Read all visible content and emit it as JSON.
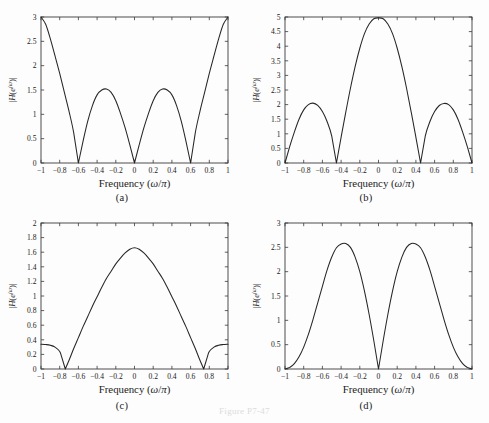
{
  "figure": {
    "caption": "Figure P7-47",
    "background": "#fdfdfd",
    "line_color": "#262626",
    "axis_color": "#3a3a3a"
  },
  "panels": [
    {
      "key": "a",
      "caption": "(a)"
    },
    {
      "key": "b",
      "caption": "(b)"
    },
    {
      "key": "c",
      "caption": "(c)"
    },
    {
      "key": "d",
      "caption": "(d)"
    }
  ],
  "chart_data": [
    {
      "type": "line",
      "panel": "(a)",
      "title": "",
      "xlabel": "Frequency (ω/π)",
      "ylabel": "|H(e^{jω})|",
      "xlim": [
        -1,
        1
      ],
      "ylim": [
        0,
        3
      ],
      "xticks": [
        -1,
        -0.8,
        -0.6,
        -0.4,
        -0.2,
        0,
        0.2,
        0.4,
        0.6,
        0.8,
        1
      ],
      "xticklabels": [
        "−1",
        "−0.8",
        "−0.6",
        "−0.4",
        "−0.2",
        "0",
        "0.2",
        "0.4",
        "0.6",
        "0.8",
        "1"
      ],
      "yticks": [
        0,
        0.5,
        1,
        1.5,
        2,
        2.5,
        3
      ],
      "yticklabels": [
        "0",
        "0.5",
        "1",
        "1.5",
        "2",
        "2.5",
        "3"
      ],
      "grid": false,
      "legend": null,
      "zeros_at": [
        -0.6,
        0,
        0.6
      ],
      "peaks": [
        {
          "x": -1,
          "y": 3
        },
        {
          "x": -0.3,
          "y": 1.52
        },
        {
          "x": 0.3,
          "y": 1.52
        },
        {
          "x": 1,
          "y": 3
        }
      ],
      "x": [
        -1,
        -0.95,
        -0.9,
        -0.85,
        -0.8,
        -0.75,
        -0.7,
        -0.65,
        -0.6,
        -0.55,
        -0.5,
        -0.45,
        -0.4,
        -0.35,
        -0.3,
        -0.25,
        -0.2,
        -0.15,
        -0.1,
        -0.05,
        0,
        0.05,
        0.1,
        0.15,
        0.2,
        0.25,
        0.3,
        0.35,
        0.4,
        0.45,
        0.5,
        0.55,
        0.6,
        0.65,
        0.7,
        0.75,
        0.8,
        0.85,
        0.9,
        0.95,
        1
      ],
      "y": [
        3.0,
        2.85,
        2.55,
        2.2,
        1.84,
        1.45,
        1.06,
        0.62,
        0.0,
        0.45,
        0.86,
        1.18,
        1.4,
        1.5,
        1.52,
        1.45,
        1.28,
        1.02,
        0.72,
        0.37,
        0.0,
        0.37,
        0.72,
        1.02,
        1.28,
        1.45,
        1.52,
        1.5,
        1.4,
        1.18,
        0.86,
        0.45,
        0.0,
        0.62,
        1.06,
        1.45,
        1.84,
        2.2,
        2.55,
        2.85,
        3.0
      ]
    },
    {
      "type": "line",
      "panel": "(b)",
      "title": "",
      "xlabel": "Frequency (ω/π)",
      "ylabel": "|H(e^{jω})|",
      "xlim": [
        -1,
        1
      ],
      "ylim": [
        0,
        5
      ],
      "xticks": [
        -1,
        -0.8,
        -0.6,
        -0.4,
        -0.2,
        0,
        0.2,
        0.4,
        0.6,
        0.8,
        1
      ],
      "xticklabels": [
        "−1",
        "−0.8",
        "−0.6",
        "−0.4",
        "−0.2",
        "0",
        "0.2",
        "0.4",
        "0.6",
        "0.8",
        "1"
      ],
      "yticks": [
        0,
        0.5,
        1,
        1.5,
        2,
        2.5,
        3,
        3.5,
        4,
        4.5,
        5
      ],
      "yticklabels": [
        "0",
        "0.5",
        "1",
        "1.5",
        "2",
        "2.5",
        "3",
        "3.5",
        "4",
        "4.5",
        "5"
      ],
      "grid": false,
      "legend": null,
      "zeros_at": [
        -1,
        -0.45,
        0.45,
        1
      ],
      "peaks": [
        {
          "x": -0.7,
          "y": 2.05
        },
        {
          "x": 0,
          "y": 4.97
        },
        {
          "x": 0.7,
          "y": 2.04
        }
      ],
      "x": [
        -1,
        -0.95,
        -0.9,
        -0.85,
        -0.8,
        -0.75,
        -0.7,
        -0.65,
        -0.6,
        -0.55,
        -0.5,
        -0.45,
        -0.4,
        -0.35,
        -0.3,
        -0.25,
        -0.2,
        -0.15,
        -0.1,
        -0.05,
        0,
        0.05,
        0.1,
        0.15,
        0.2,
        0.25,
        0.3,
        0.35,
        0.4,
        0.45,
        0.5,
        0.55,
        0.6,
        0.65,
        0.7,
        0.75,
        0.8,
        0.85,
        0.9,
        0.95,
        1
      ],
      "y": [
        0.0,
        0.56,
        1.06,
        1.5,
        1.82,
        2.0,
        2.05,
        1.97,
        1.76,
        1.42,
        0.92,
        0.0,
        0.88,
        1.74,
        2.56,
        3.3,
        3.93,
        4.43,
        4.76,
        4.94,
        4.97,
        4.94,
        4.76,
        4.43,
        3.93,
        3.3,
        2.56,
        1.74,
        0.88,
        0.0,
        0.92,
        1.42,
        1.76,
        1.97,
        2.04,
        2.0,
        1.82,
        1.5,
        1.06,
        0.56,
        0.0
      ]
    },
    {
      "type": "line",
      "panel": "(c)",
      "title": "",
      "xlabel": "Frequency (ω/π)",
      "ylabel": "|H(e^{jω})|",
      "xlim": [
        -1,
        1
      ],
      "ylim": [
        0,
        2
      ],
      "xticks": [
        -1,
        -0.8,
        -0.6,
        -0.4,
        -0.2,
        0,
        0.2,
        0.4,
        0.6,
        0.8,
        1
      ],
      "xticklabels": [
        "−1",
        "−0.8",
        "−0.6",
        "−0.4",
        "−0.2",
        "0",
        "0.2",
        "0.4",
        "0.6",
        "0.8",
        "1"
      ],
      "yticks": [
        0,
        0.2,
        0.4,
        0.6,
        0.8,
        1,
        1.2,
        1.4,
        1.6,
        1.8,
        2
      ],
      "yticklabels": [
        "0",
        "0.2",
        "0.4",
        "0.6",
        "0.8",
        "1",
        "1.2",
        "1.4",
        "1.6",
        "1.8",
        "2"
      ],
      "grid": false,
      "legend": null,
      "zeros_at": [
        -0.74,
        0.74
      ],
      "peaks": [
        {
          "x": -1,
          "y": 0.34
        },
        {
          "x": 0,
          "y": 1.66
        },
        {
          "x": 1,
          "y": 0.34
        }
      ],
      "x": [
        -1,
        -0.95,
        -0.9,
        -0.85,
        -0.8,
        -0.78,
        -0.74,
        -0.7,
        -0.65,
        -0.6,
        -0.55,
        -0.5,
        -0.45,
        -0.4,
        -0.35,
        -0.3,
        -0.25,
        -0.2,
        -0.15,
        -0.1,
        -0.05,
        0,
        0.05,
        0.1,
        0.15,
        0.2,
        0.25,
        0.3,
        0.35,
        0.4,
        0.45,
        0.5,
        0.55,
        0.6,
        0.65,
        0.7,
        0.74,
        0.78,
        0.8,
        0.85,
        0.9,
        0.95,
        1
      ],
      "y": [
        0.34,
        0.335,
        0.325,
        0.3,
        0.24,
        0.17,
        0.0,
        0.12,
        0.28,
        0.43,
        0.58,
        0.72,
        0.86,
        0.99,
        1.12,
        1.24,
        1.34,
        1.44,
        1.52,
        1.59,
        1.64,
        1.66,
        1.64,
        1.59,
        1.52,
        1.44,
        1.34,
        1.24,
        1.12,
        0.99,
        0.86,
        0.72,
        0.58,
        0.43,
        0.28,
        0.12,
        0.0,
        0.17,
        0.24,
        0.3,
        0.325,
        0.335,
        0.34
      ]
    },
    {
      "type": "line",
      "panel": "(d)",
      "title": "",
      "xlabel": "Frequency (ω/π)",
      "ylabel": "|H(e^{jω})|",
      "xlim": [
        -1,
        1
      ],
      "ylim": [
        0,
        3
      ],
      "xticks": [
        -1,
        -0.8,
        -0.6,
        -0.4,
        -0.2,
        0,
        0.2,
        0.4,
        0.6,
        0.8,
        1
      ],
      "xticklabels": [
        "−1",
        "−0.8",
        "−0.6",
        "−0.4",
        "−0.2",
        "0",
        "0.2",
        "0.4",
        "0.6",
        "0.8",
        "1"
      ],
      "yticks": [
        0,
        0.5,
        1,
        1.5,
        2,
        2.5,
        3
      ],
      "yticklabels": [
        "0",
        "0.5",
        "1",
        "1.5",
        "2",
        "2.5",
        "3"
      ],
      "grid": false,
      "legend": null,
      "zeros_at": [
        -1,
        0,
        1
      ],
      "peaks": [
        {
          "x": -0.35,
          "y": 2.58
        },
        {
          "x": 0.35,
          "y": 2.58
        }
      ],
      "x": [
        -1,
        -0.95,
        -0.9,
        -0.85,
        -0.8,
        -0.75,
        -0.7,
        -0.65,
        -0.6,
        -0.55,
        -0.5,
        -0.45,
        -0.4,
        -0.35,
        -0.3,
        -0.25,
        -0.2,
        -0.15,
        -0.1,
        -0.05,
        0,
        0.05,
        0.1,
        0.15,
        0.2,
        0.25,
        0.3,
        0.35,
        0.4,
        0.45,
        0.5,
        0.55,
        0.6,
        0.65,
        0.7,
        0.75,
        0.8,
        0.85,
        0.9,
        0.95,
        1
      ],
      "y": [
        0.0,
        0.03,
        0.11,
        0.25,
        0.45,
        0.71,
        1.02,
        1.36,
        1.7,
        2.03,
        2.3,
        2.49,
        2.57,
        2.58,
        2.5,
        2.3,
        2.0,
        1.6,
        1.12,
        0.58,
        0.0,
        0.58,
        1.12,
        1.6,
        2.0,
        2.3,
        2.5,
        2.58,
        2.57,
        2.49,
        2.3,
        2.03,
        1.7,
        1.36,
        1.02,
        0.71,
        0.45,
        0.25,
        0.11,
        0.03,
        0.0
      ]
    }
  ]
}
